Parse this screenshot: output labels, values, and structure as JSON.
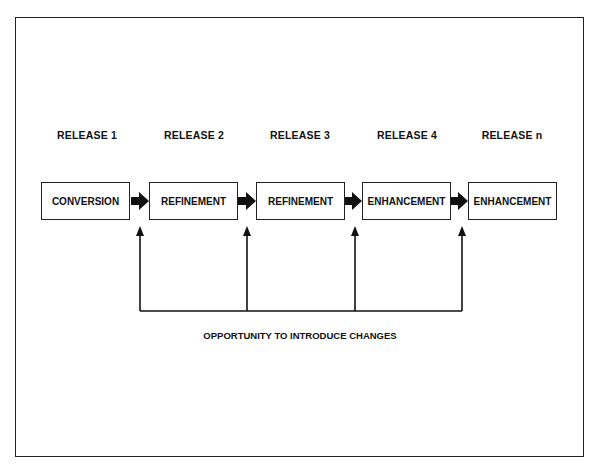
{
  "diagram": {
    "releases": [
      {
        "label": "RELEASE 1",
        "stage": "CONVERSION"
      },
      {
        "label": "RELEASE 2",
        "stage": "REFINEMENT"
      },
      {
        "label": "RELEASE 3",
        "stage": "REFINEMENT"
      },
      {
        "label": "RELEASE 4",
        "stage": "ENHANCEMENT"
      },
      {
        "label": "RELEASE n",
        "stage": "ENHANCEMENT"
      }
    ],
    "caption": "OPPORTUNITY TO INTRODUCE CHANGES",
    "colors": {
      "line": "#222222",
      "background": "#ffffff"
    }
  }
}
